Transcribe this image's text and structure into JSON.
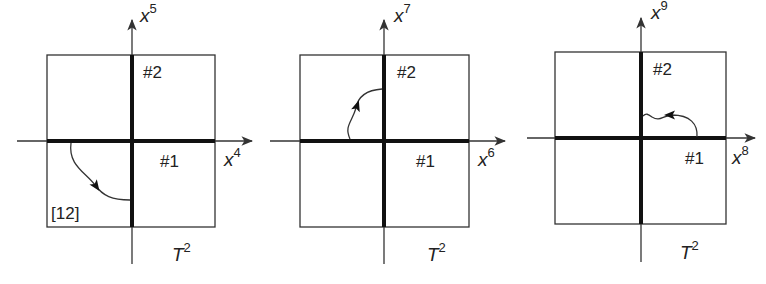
{
  "figure": {
    "colors": {
      "line": "#333333",
      "thick": "#111111",
      "text": "#222222",
      "background": "#ffffff"
    },
    "panels": [
      {
        "id": "panel-1",
        "axis_x_label": "x",
        "axis_x_sup": "4",
        "axis_y_label": "x",
        "axis_y_sup": "5",
        "brane_1_label": "#1",
        "brane_2_label": "#2",
        "torus_label": "T",
        "torus_sup": "2",
        "annotation": "[12]",
        "geom": {
          "box": [
            47,
            55,
            215,
            227
          ],
          "origin": [
            132,
            141
          ],
          "h_axis": [
            17,
            252
          ],
          "v_axis": [
            20,
            264
          ],
          "thick_h": [
            47,
            215
          ],
          "thick_v": [
            55,
            227
          ],
          "curve": "M 71 143 C 68 165, 85 172, 95 185 C 103 196, 112 200, 130 200",
          "arrow_at": [
            96,
            186
          ],
          "arrow_angle": 55,
          "x_label_pos": [
            224,
            166
          ],
          "y_label_pos": [
            140,
            22
          ],
          "b1_pos": [
            160,
            167
          ],
          "b2_pos": [
            143,
            78
          ],
          "t_pos": [
            172,
            261
          ],
          "ann_pos": [
            51,
            219
          ]
        }
      },
      {
        "id": "panel-2",
        "axis_x_label": "x",
        "axis_x_sup": "6",
        "axis_y_label": "x",
        "axis_y_sup": "7",
        "brane_1_label": "#1",
        "brane_2_label": "#2",
        "torus_label": "T",
        "torus_sup": "2",
        "annotation": "",
        "geom": {
          "box": [
            300,
            55,
            469,
            227
          ],
          "origin": [
            384,
            141
          ],
          "h_axis": [
            270,
            505
          ],
          "v_axis": [
            20,
            264
          ],
          "thick_h": [
            300,
            469
          ],
          "thick_v": [
            55,
            227
          ],
          "curve": "M 350 139 C 344 126, 352 122, 356 108 C 358 96, 368 90, 382 89",
          "arrow_at": [
            357,
            106
          ],
          "arrow_angle": -72,
          "x_label_pos": [
            478,
            166
          ],
          "y_label_pos": [
            394,
            22
          ],
          "b1_pos": [
            416,
            167
          ],
          "b2_pos": [
            397,
            78
          ],
          "t_pos": [
            427,
            261
          ],
          "ann_pos": [
            0,
            0
          ]
        }
      },
      {
        "id": "panel-3",
        "axis_x_label": "x",
        "axis_x_sup": "8",
        "axis_y_label": "x",
        "axis_y_sup": "9",
        "brane_1_label": "#1",
        "brane_2_label": "#2",
        "torus_label": "T",
        "torus_sup": "2",
        "annotation": "",
        "geom": {
          "box": [
            555,
            52,
            726,
            224
          ],
          "origin": [
            641,
            138
          ],
          "h_axis": [
            527,
            755
          ],
          "v_axis": [
            18,
            262
          ],
          "thick_h": [
            555,
            726
          ],
          "thick_v": [
            52,
            224
          ],
          "curve": "M 697 137 C 698 124, 690 115, 672 115 C 662 116, 660 122, 652 117 C 648 114, 646 113, 643 116",
          "arrow_at": [
            670,
            115
          ],
          "arrow_angle": 180,
          "x_label_pos": [
            732,
            164
          ],
          "y_label_pos": [
            651,
            19
          ],
          "b1_pos": [
            685,
            164
          ],
          "b2_pos": [
            653,
            75
          ],
          "t_pos": [
            680,
            259
          ],
          "ann_pos": [
            0,
            0
          ]
        }
      }
    ]
  }
}
